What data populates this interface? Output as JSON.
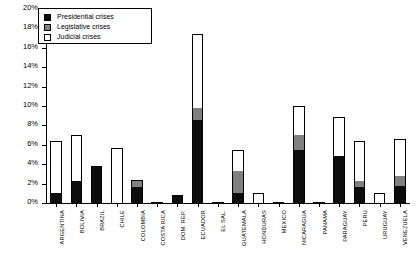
{
  "chart_data": {
    "type": "bar",
    "subtype": "stacked-vertical",
    "title": "",
    "xlabel": "",
    "ylabel": "",
    "ylim": [
      0,
      20
    ],
    "ytick_labels": [
      "0%",
      "2%",
      "4%",
      "6%",
      "8%",
      "10%",
      "12%",
      "14%",
      "16%",
      "18%",
      "20%"
    ],
    "ytick_values": [
      0,
      2,
      4,
      6,
      8,
      10,
      12,
      14,
      16,
      18,
      20
    ],
    "grid": false,
    "legend_position": "top-left-inside",
    "categories": [
      "ARGENTINA",
      "BOLIVIA",
      "BRAZIL",
      "CHILE",
      "COLOMBIA",
      "COSTA RICA",
      "DOM. REP.",
      "ECUADOR",
      "EL SAL.",
      "GUATEMALA",
      "HONDURAS",
      "MEXICO",
      "NICARAGUA",
      "PANAMA",
      "PARAGUAY",
      "PERU",
      "URUGUAY",
      "VENEZUELA"
    ],
    "series": [
      {
        "name": "Presidential crises",
        "color": "#0d0d0d",
        "values": [
          1.0,
          2.3,
          3.8,
          0.0,
          1.7,
          0.0,
          0.8,
          8.6,
          0.0,
          1.0,
          0.0,
          0.0,
          5.5,
          0.0,
          4.8,
          1.6,
          0.0,
          1.8
        ]
      },
      {
        "name": "Legislative crises",
        "color": "#808080",
        "values": [
          0.0,
          0.0,
          0.0,
          0.0,
          0.7,
          0.0,
          0.0,
          1.2,
          0.0,
          2.3,
          0.0,
          0.0,
          1.5,
          0.0,
          0.0,
          0.7,
          0.0,
          1.0
        ]
      },
      {
        "name": "Judicial crises",
        "color": "#ffffff",
        "values": [
          5.4,
          4.7,
          0.0,
          5.7,
          0.0,
          0.0,
          0.0,
          7.6,
          0.0,
          2.2,
          1.0,
          0.0,
          3.0,
          0.0,
          4.1,
          4.1,
          1.0,
          3.8
        ]
      }
    ],
    "totals": [
      6.4,
      7.0,
      3.8,
      5.7,
      2.4,
      0.0,
      0.8,
      17.4,
      0.0,
      5.5,
      1.0,
      0.0,
      10.0,
      0.0,
      8.9,
      6.4,
      1.0,
      6.6
    ]
  },
  "legend": {
    "items": [
      {
        "label": "Presidential crises",
        "key": "presidential"
      },
      {
        "label": "Legislative crises",
        "key": "legislative"
      },
      {
        "label": "Judicial crises",
        "key": "judicial"
      }
    ]
  }
}
